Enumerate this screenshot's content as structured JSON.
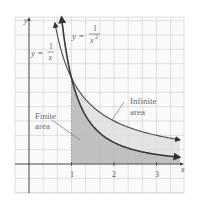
{
  "chart_data": {
    "type": "line",
    "title": "",
    "xlabel": "x",
    "ylabel": "y",
    "xlim": [
      -0.33,
      3.65
    ],
    "ylim": [
      -0.34,
      1.71
    ],
    "grid": true,
    "x_ticks": [
      1,
      2,
      3
    ],
    "x_tick_labels": [
      "1",
      "2",
      "3"
    ],
    "series": [
      {
        "name": "y = 1/x",
        "label_main": "y =",
        "label_num": "1",
        "label_den": "x",
        "function": "1/x",
        "x": [
          0.61,
          0.75,
          1,
          1.5,
          2,
          2.5,
          3,
          3.62
        ],
        "y": [
          1.64,
          1.33,
          1,
          0.667,
          0.5,
          0.4,
          0.333,
          0.276
        ]
      },
      {
        "name": "y = 1/x^2",
        "label_main": "y =",
        "label_num": "1",
        "label_den": "x",
        "label_exp": "2",
        "function": "1/x^2",
        "x": [
          0.76,
          0.85,
          1,
          1.5,
          2,
          2.5,
          3,
          3.62
        ],
        "y": [
          1.73,
          1.38,
          1,
          0.444,
          0.25,
          0.16,
          0.111,
          0.076
        ]
      }
    ],
    "shaded_regions": [
      {
        "name": "Finite area",
        "between": [
          "x-axis",
          "1/x^2"
        ],
        "from_x": 1,
        "color": "#b9b9b9"
      },
      {
        "name": "Infinite area",
        "between": [
          "1/x^2",
          "1/x"
        ],
        "from_x": 1,
        "color": "#dedede"
      }
    ],
    "annotations": [
      {
        "text_lines": [
          "Finite",
          "area"
        ]
      },
      {
        "text_lines": [
          "Infinite",
          "area"
        ]
      }
    ]
  },
  "labels": {
    "x_axis": "x",
    "y_axis": "y",
    "tick_1": "1",
    "tick_2": "2",
    "tick_3": "3",
    "curve1_prefix": "y =",
    "curve1_num": "1",
    "curve1_den": "x",
    "curve2_prefix": "y =",
    "curve2_num": "1",
    "curve2_den": "x",
    "curve2_exp": "2",
    "finite_line1": "Finite",
    "finite_line2": "area",
    "infinite_line1": "Infinite",
    "infinite_line2": "area"
  },
  "colors": {
    "background": "#ffffff",
    "grid": "#cfcfcf",
    "axis": "#444444",
    "curve": "#3a3a3a",
    "finite_fill": "#b9b9b9",
    "infinite_fill": "#dedede",
    "label_text": "#6a6a6a"
  }
}
